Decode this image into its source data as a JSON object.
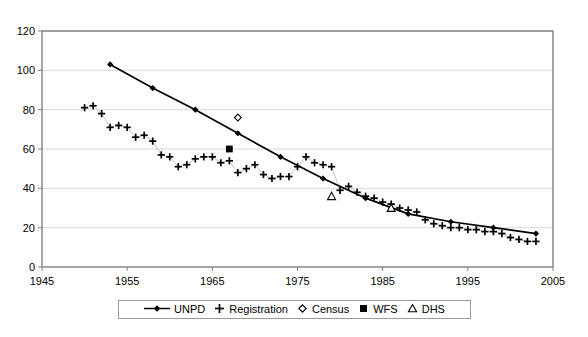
{
  "chart_data": {
    "type": "line",
    "title": "",
    "xlabel": "",
    "ylabel": "",
    "xlim": [
      1945,
      2005
    ],
    "ylim": [
      0,
      120
    ],
    "xticks": [
      1945,
      1955,
      1965,
      1975,
      1985,
      1995,
      2005
    ],
    "yticks": [
      0,
      20,
      40,
      60,
      80,
      100,
      120
    ],
    "grid": "horizontal",
    "legend_position": "bottom-center",
    "series": [
      {
        "name": "UNPD",
        "marker": "filled-diamond",
        "line": "solid",
        "color": "#000000",
        "x": [
          1953,
          1958,
          1963,
          1968,
          1973,
          1978,
          1983,
          1988,
          1993,
          1998,
          2003
        ],
        "values": [
          103,
          91,
          80,
          68,
          56,
          45,
          35,
          27,
          23,
          20,
          17
        ]
      },
      {
        "name": "Registration",
        "marker": "plus",
        "line": "thin-gray",
        "color": "#000000",
        "x": [
          1950,
          1951,
          1952,
          1953,
          1954,
          1955,
          1956,
          1957,
          1958,
          1959,
          1960,
          1961,
          1962,
          1963,
          1964,
          1965,
          1966,
          1967,
          1968,
          1969,
          1970,
          1971,
          1972,
          1973,
          1974,
          1975,
          1976,
          1977,
          1978,
          1979,
          1980,
          1981,
          1982,
          1983,
          1984,
          1985,
          1986,
          1987,
          1988,
          1989,
          1990,
          1991,
          1992,
          1993,
          1994,
          1995,
          1996,
          1997,
          1998,
          1999,
          2000,
          2001,
          2002,
          2003
        ],
        "values": [
          81,
          82,
          78,
          71,
          72,
          71,
          66,
          67,
          64,
          57,
          56,
          51,
          52,
          55,
          56,
          56,
          53,
          54,
          48,
          50,
          52,
          47,
          45,
          46,
          46,
          51,
          56,
          53,
          52,
          51,
          39,
          41,
          38,
          36,
          35,
          33,
          32,
          30,
          29,
          28,
          24,
          22,
          21,
          20,
          20,
          19,
          19,
          18,
          18,
          17,
          15,
          14,
          13,
          13
        ]
      },
      {
        "name": "Census",
        "marker": "open-diamond",
        "line": "none",
        "color": "#000000",
        "x": [
          1968
        ],
        "values": [
          76
        ]
      },
      {
        "name": "WFS",
        "marker": "filled-square",
        "line": "none",
        "color": "#000000",
        "x": [
          1967
        ],
        "values": [
          60
        ]
      },
      {
        "name": "DHS",
        "marker": "open-triangle",
        "line": "none",
        "color": "#000000",
        "x": [
          1979,
          1986
        ],
        "values": [
          36,
          30
        ]
      }
    ]
  },
  "legend": {
    "items": [
      {
        "label": "UNPD",
        "symbol": "line-diamond"
      },
      {
        "label": "Registration",
        "symbol": "plus"
      },
      {
        "label": "Census",
        "symbol": "open-diamond"
      },
      {
        "label": "WFS",
        "symbol": "filled-square"
      },
      {
        "label": "DHS",
        "symbol": "open-triangle"
      }
    ]
  },
  "axes": {
    "x_tick_labels": [
      "1945",
      "1955",
      "1965",
      "1975",
      "1985",
      "1995",
      "2005"
    ],
    "y_tick_labels": [
      "0",
      "20",
      "40",
      "60",
      "80",
      "100",
      "120"
    ]
  },
  "colors": {
    "ink": "#000000",
    "axis": "#808080",
    "grid": "#d9d9d9",
    "legend_border": "#9a9a9a"
  }
}
